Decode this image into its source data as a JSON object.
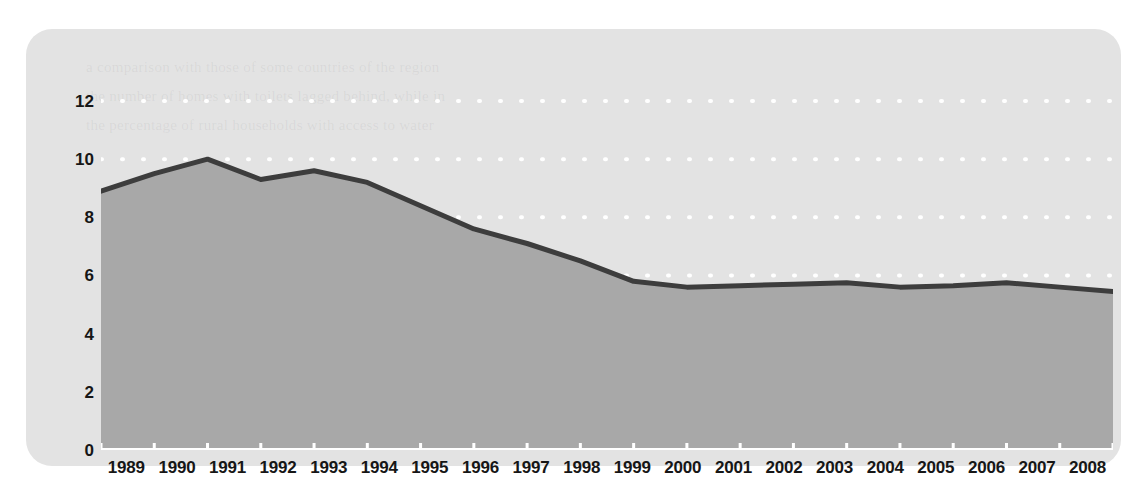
{
  "figure": {
    "background_color": "#ffffff",
    "card_color": "#e3e3e3",
    "watermark_text": "a comparison with those of some countries of the region\nthe number of homes with toilets lagged behind, while in\nthe percentage of rural households with access to water"
  },
  "chart_data": {
    "type": "area",
    "title": "",
    "subtitle": "",
    "xlabel": "",
    "ylabel": "",
    "categories": [
      "1989",
      "1990",
      "1991",
      "1992",
      "1993",
      "1994",
      "1995",
      "1996",
      "1997",
      "1998",
      "1999",
      "2000",
      "2001",
      "2002",
      "2003",
      "2004",
      "2005",
      "2006",
      "2007",
      "2008"
    ],
    "values": [
      8.9,
      9.5,
      10.0,
      9.3,
      9.6,
      9.2,
      8.4,
      7.6,
      7.1,
      6.5,
      5.8,
      5.6,
      5.65,
      5.7,
      5.75,
      5.6,
      5.65,
      5.75,
      5.6,
      5.45
    ],
    "series": [
      {
        "name": "series-1",
        "values": [
          8.9,
          9.5,
          10.0,
          9.3,
          9.6,
          9.2,
          8.4,
          7.6,
          7.1,
          6.5,
          5.8,
          5.6,
          5.65,
          5.7,
          5.75,
          5.6,
          5.65,
          5.75,
          5.6,
          5.45
        ]
      }
    ],
    "ylim": [
      0,
      13.1
    ],
    "xlim": [
      0,
      19
    ],
    "y_ticks": [
      0,
      2,
      4,
      6,
      8,
      10,
      12
    ],
    "y_tick_labels": [
      "0",
      "2",
      "4",
      "6",
      "8",
      "10",
      "12"
    ],
    "x_tick_labels": [
      "1989",
      "1990",
      "1991",
      "1992",
      "1993",
      "1994",
      "1995",
      "1996",
      "1997",
      "1998",
      "1999",
      "2000",
      "2001",
      "2002",
      "2003",
      "2004",
      "2005",
      "2006",
      "2007",
      "2008"
    ],
    "grid": true,
    "grid_style": "dotted",
    "grid_color": "#ffffff",
    "legend": null,
    "legend_position": "none",
    "area_fill_color": "#a8a8a8",
    "line_color": "#3d3d3d",
    "line_width": 5,
    "axis_color": "#ffffff",
    "tick_color": "#ffffff",
    "annotations": []
  }
}
